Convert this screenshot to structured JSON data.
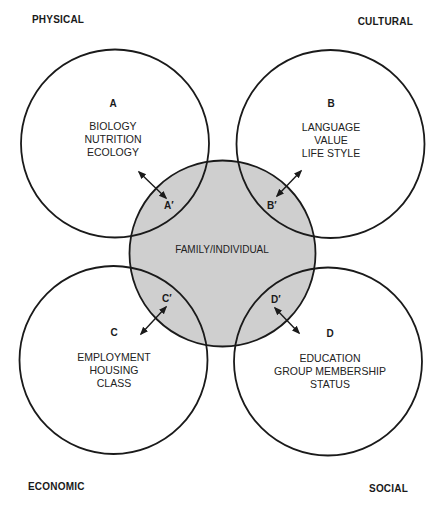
{
  "diagram": {
    "corner_labels": {
      "top_left": "PHYSICAL",
      "top_right": "CULTURAL",
      "bottom_left": "ECONOMIC",
      "bottom_right": "SOCIAL"
    },
    "center": {
      "label": "FAMILY/INDIVIDUAL",
      "fill": "#cfcfcf"
    },
    "circles": [
      {
        "letter": "A",
        "prime": "A′",
        "items": [
          "BIOLOGY",
          "NUTRITION",
          "ECOLOGY"
        ]
      },
      {
        "letter": "B",
        "prime": "B′",
        "items": [
          "LANGUAGE",
          "VALUE",
          "LIFE STYLE"
        ]
      },
      {
        "letter": "C",
        "prime": "C′",
        "items": [
          "EMPLOYMENT",
          "HOUSING",
          "CLASS"
        ]
      },
      {
        "letter": "D",
        "prime": "D′",
        "items": [
          "EDUCATION",
          "GROUP MEMBERSHIP",
          "STATUS"
        ]
      }
    ],
    "colors": {
      "stroke": "#1a1a1a",
      "background": "#ffffff"
    }
  }
}
